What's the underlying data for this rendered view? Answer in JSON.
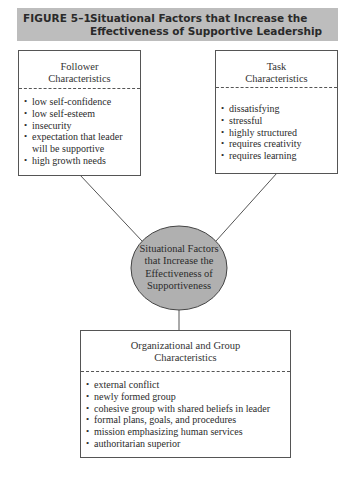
{
  "figure": {
    "number": "FIGURE 5–1",
    "title_line1": "Situational Factors that Increase the",
    "title_line2": "Effectiveness of Supportive Leadership"
  },
  "center_node": {
    "line1": "Situational Factors",
    "line2": "that Increase the",
    "line3": "Effectiveness of",
    "line4": "Supportiveness",
    "fill_color": "#b0b0b0"
  },
  "follower_box": {
    "heading_line1": "Follower",
    "heading_line2": "Characteristics",
    "items": [
      "low self-confidence",
      "low self-esteem",
      "insecurity",
      "expectation that leader will be supportive",
      "high growth needs"
    ]
  },
  "task_box": {
    "heading_line1": "Task",
    "heading_line2": "Characteristics",
    "items": [
      "dissatisfying",
      "stressful",
      "highly structured",
      "requires creativity",
      "requires learning"
    ]
  },
  "org_box": {
    "heading_line1": "Organizational and Group",
    "heading_line2": "Characteristics",
    "items": [
      "external conflict",
      "newly formed group",
      "cohesive group with shared beliefs in leader",
      "formal plans, goals, and procedures",
      "mission emphasizing human services",
      "authoritarian superior"
    ]
  },
  "colors": {
    "banner_bg": "#bdbdbd",
    "line": "#555555"
  }
}
